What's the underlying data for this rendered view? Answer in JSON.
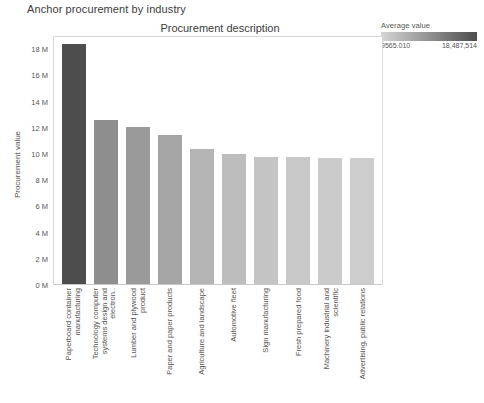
{
  "page_title": "Anchor procurement by industry",
  "legend": {
    "title": "Average value",
    "min_label": "9565.010",
    "max_label": "18,487,514",
    "min_color": "#d5d5d5",
    "max_color": "#4d4d4d"
  },
  "chart_data": {
    "type": "bar",
    "title": "Procurement description",
    "xlabel": "",
    "ylabel": "Procurement value",
    "ylim": [
      0,
      19000000
    ],
    "ytick_labels": [
      "18 M",
      "16 M",
      "14 M",
      "12 M",
      "10 M",
      "8 M",
      "6 M",
      "4 M",
      "2 M",
      "0 M"
    ],
    "ytick_values": [
      18000000,
      16000000,
      14000000,
      12000000,
      10000000,
      8000000,
      6000000,
      4000000,
      2000000,
      0
    ],
    "grid": false,
    "legend_position": "top-right",
    "categories": [
      "Paperboard container manufacturing",
      "Technology computer systems design and electron..",
      "Lumber and plywood product",
      "Paper and paper products",
      "Agriculture and landscape",
      "Automotive fleet",
      "Sign manufacturing",
      "Fresh prepared food",
      "Machinery industrial and scientific",
      "Advertising, public relations"
    ],
    "values": [
      18487514,
      12600000,
      12100000,
      11500000,
      10400000,
      10000000,
      9800000,
      9750000,
      9700000,
      9700000
    ],
    "colors": [
      "#4d4d4d",
      "#8e8e8e",
      "#9a9a9a",
      "#a5a5a5",
      "#b4b4b4",
      "#bdbdbd",
      "#c4c4c4",
      "#c8c8c8",
      "#cbcbcb",
      "#cdcdcd"
    ]
  }
}
